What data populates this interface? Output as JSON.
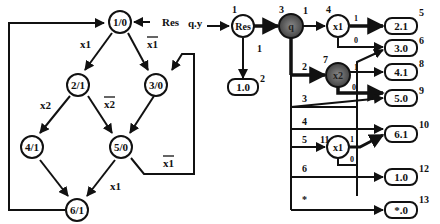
{
  "state_graph": {
    "input_label": "Res",
    "nodes": [
      {
        "id": "n1",
        "label": "1/0"
      },
      {
        "id": "n2",
        "label": "2/1"
      },
      {
        "id": "n3",
        "label": "3/0"
      },
      {
        "id": "n4",
        "label": "4/1"
      },
      {
        "id": "n5",
        "label": "5/0"
      },
      {
        "id": "n6",
        "label": "6/1"
      }
    ],
    "edge_labels": {
      "e12": "x1",
      "e13": "x1",
      "e24": "x2",
      "e25": "x2",
      "e56": "x1",
      "e53": "x1"
    }
  },
  "decision_diagram": {
    "input_label": "q.y",
    "nodes": [
      {
        "num": "1",
        "label": "Res"
      },
      {
        "num": "2",
        "label": "1.0"
      },
      {
        "num": "3",
        "label": "q"
      },
      {
        "num": "4",
        "label": "x1"
      },
      {
        "num": "5",
        "label": "2.1"
      },
      {
        "num": "6",
        "label": "3.0"
      },
      {
        "num": "7",
        "label": "x2"
      },
      {
        "num": "8",
        "label": "4.1"
      },
      {
        "num": "9",
        "label": "5.0"
      },
      {
        "num": "10",
        "label": "6.1"
      },
      {
        "num": "11",
        "label": "x1"
      },
      {
        "num": "12",
        "label": "1.0"
      },
      {
        "num": "13",
        "label": "*.0"
      }
    ],
    "edge_labels": {
      "res_1": "1",
      "q_1": "1",
      "q_2": "2",
      "q_3": "3",
      "q_4": "4",
      "q_5": "5",
      "q_6": "6",
      "q_star": "*",
      "x1a_1": "1",
      "x1a_0": "0",
      "x2_1": "1",
      "x2_0": "0",
      "x1b_1": "1",
      "x1b_0": "0"
    }
  }
}
